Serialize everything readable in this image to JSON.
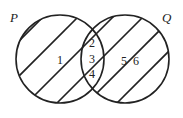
{
  "diagram": {
    "type": "venn",
    "sets": [
      {
        "name": "P",
        "cx": 60,
        "cy": 59,
        "r": 44,
        "label_x": 10,
        "label_y": 22
      },
      {
        "name": "Q",
        "cx": 125,
        "cy": 59,
        "r": 44,
        "label_x": 162,
        "label_y": 22
      }
    ],
    "regions": [
      {
        "label": "1",
        "x": 58,
        "y": 64
      },
      {
        "label": "2",
        "x": 91,
        "y": 47
      },
      {
        "label": "3",
        "x": 91,
        "y": 64
      },
      {
        "label": "4",
        "x": 91,
        "y": 79
      },
      {
        "label": "5",
        "x": 122,
        "y": 65
      },
      {
        "label": "6",
        "x": 134,
        "y": 65
      }
    ],
    "stroke_color": "#222222",
    "hatch": "diagonal"
  }
}
